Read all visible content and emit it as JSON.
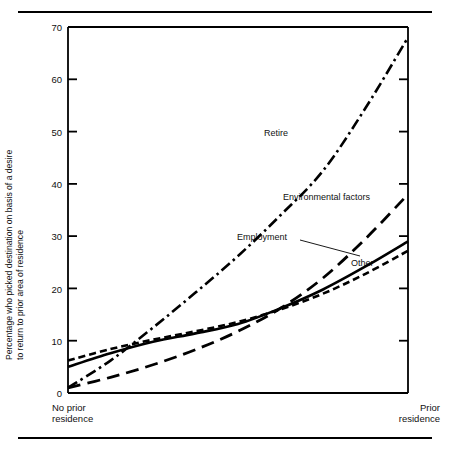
{
  "figure": {
    "has_top_rule": true,
    "has_bottom_rule": true
  },
  "chart_data": {
    "type": "line",
    "title": "",
    "subtitle": "",
    "xlabel": "",
    "ylabel": "Percentage who picked destination on basis of a desire to return to prior area of residence",
    "ylabel_line1": "Percentage who picked destination on basis of a desire",
    "ylabel_line2": "to return to prior area of residence",
    "ylim": [
      0,
      70
    ],
    "yticks": [
      0,
      10,
      20,
      30,
      40,
      50,
      60,
      70
    ],
    "ytick_labels": [
      "0",
      "10",
      "20",
      "30",
      "40",
      "50",
      "60",
      "70"
    ],
    "xlim": [
      0,
      1
    ],
    "xtick_labels": [
      "No prior residence",
      "Prior residence"
    ],
    "xtick_label_left_line1": "No prior",
    "xtick_label_left_line2": "residence",
    "xtick_label_right_line1": "Prior",
    "xtick_label_right_line2": "residence",
    "grid": false,
    "legend_position": "inline-annotations",
    "axis_color": "#000000",
    "line_color": "#000000",
    "x": [
      0,
      0.125,
      0.25,
      0.375,
      0.5,
      0.625,
      0.75,
      0.875,
      1
    ],
    "series": [
      {
        "name": "Retire",
        "label": "Retire",
        "style": "dash-dot",
        "dasharray": "11,4,2.5,4",
        "width": 2.6,
        "values": [
          1.0,
          6.2,
          12.5,
          19.2,
          26.2,
          34.0,
          42.5,
          54.5,
          68.0
        ]
      },
      {
        "name": "Environmental factors",
        "label": "Environmental factors",
        "style": "long-dash",
        "dasharray": "13,7",
        "width": 2.8,
        "values": [
          1.0,
          3.0,
          5.4,
          8.3,
          11.8,
          16.2,
          22.0,
          29.5,
          38.0
        ]
      },
      {
        "name": "Employment",
        "label": "Employment",
        "style": "solid",
        "dasharray": "none",
        "width": 2.6,
        "values": [
          5.0,
          7.6,
          9.8,
          11.4,
          13.2,
          16.2,
          19.8,
          24.2,
          29.0
        ]
      },
      {
        "name": "Other",
        "label": "Other",
        "style": "short-dash",
        "dasharray": "7,4",
        "width": 2.6,
        "values": [
          6.2,
          8.4,
          10.2,
          11.8,
          13.6,
          16.0,
          19.0,
          22.8,
          27.2
        ]
      }
    ],
    "annotations": [
      {
        "text": "Retire",
        "x": 0.6,
        "y": 49
      },
      {
        "text": "Environmental factors",
        "x": 0.63,
        "y": 38
      },
      {
        "text": "Employment",
        "x": 0.5,
        "y": 30
      },
      {
        "text": "Other",
        "x": 0.82,
        "y": 23
      }
    ]
  }
}
